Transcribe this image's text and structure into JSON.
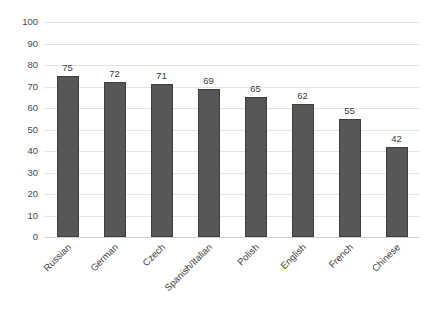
{
  "chart_data": {
    "type": "bar",
    "title": "",
    "subtitle": "",
    "xlabel": "",
    "ylabel": "",
    "categories": [
      "Russian",
      "German",
      "Czech",
      "Spanish/Italian",
      "Polish",
      "English",
      "French",
      "Chinese"
    ],
    "values": [
      75,
      72,
      71,
      69,
      65,
      62,
      55,
      42
    ],
    "value_labels": [
      "75",
      "72",
      "71",
      "69",
      "65",
      "62",
      "55",
      "42"
    ],
    "ylim": [
      0,
      100
    ],
    "ytick_labels": [
      "100",
      "90",
      "80",
      "70",
      "60",
      "50",
      "40",
      "30",
      "20",
      "10",
      "0"
    ],
    "ytick_values": [
      100,
      90,
      80,
      70,
      60,
      50,
      40,
      30,
      20,
      10,
      0
    ],
    "grid": true,
    "grid_axis": "y",
    "legend": false,
    "legend_position": "none",
    "annotations": [],
    "colors": {
      "bar_fill": "#575757",
      "bar_edge": "#3f3f3f",
      "gridline": "#e3e3e3",
      "baseline": "#d2d2d2",
      "tick_text": "#4a4a4a",
      "value_text": "#3b3b3b",
      "category_text": "#3f3f3f",
      "background": "#ffffff"
    }
  }
}
